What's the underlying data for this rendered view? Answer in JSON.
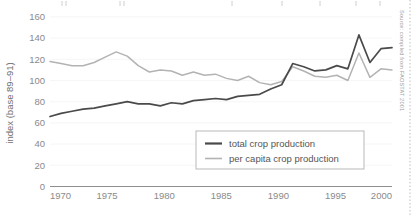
{
  "chart_data": {
    "type": "line",
    "title": "",
    "xlabel": "",
    "ylabel": "index (base 89–91)",
    "xlim": [
      1970,
      2001
    ],
    "ylim": [
      0,
      165
    ],
    "xticks": [
      1970,
      1975,
      1980,
      1985,
      1990,
      1995,
      2000
    ],
    "yticks": [
      0,
      20,
      40,
      60,
      80,
      100,
      120,
      140,
      160
    ],
    "grid": true,
    "legend_position": "bottom-right",
    "x": [
      1970,
      1971,
      1972,
      1973,
      1974,
      1975,
      1976,
      1977,
      1978,
      1979,
      1980,
      1981,
      1982,
      1983,
      1984,
      1985,
      1986,
      1987,
      1988,
      1989,
      1990,
      1991,
      1992,
      1993,
      1994,
      1995,
      1996,
      1997,
      1998,
      1999,
      2000,
      2001
    ],
    "series": [
      {
        "name": "total crop production",
        "color": "#4a4a4a",
        "values": [
          66,
          69,
          71,
          73,
          74,
          76,
          78,
          80,
          78,
          78,
          76,
          79,
          78,
          81,
          82,
          83,
          82,
          85,
          86,
          87,
          92,
          96,
          116,
          113,
          109,
          110,
          114,
          111,
          143,
          117,
          130,
          131
        ]
      },
      {
        "name": "per capita crop production",
        "color": "#b3b3b3",
        "values": [
          118,
          116,
          114,
          114,
          117,
          122,
          127,
          123,
          114,
          108,
          110,
          109,
          105,
          108,
          105,
          106,
          102,
          100,
          104,
          98,
          96,
          99,
          113,
          109,
          104,
          103,
          105,
          100,
          126,
          103,
          111,
          110
        ]
      }
    ],
    "legend": [
      {
        "label": "total crop production",
        "style": "dark-line"
      },
      {
        "label": "per capita crop production",
        "style": "light-line"
      }
    ]
  },
  "yaxis": {
    "title": "index (base 89–91)",
    "labels": [
      "160",
      "140",
      "120",
      "100",
      "80",
      "60",
      "40",
      "20",
      "0"
    ]
  },
  "xaxis": {
    "labels": [
      "1970",
      "1975",
      "1980",
      "1985",
      "1990",
      "1995",
      "2000"
    ]
  },
  "legend": {
    "items": [
      {
        "label": "total crop production"
      },
      {
        "label": "per capita crop production"
      }
    ]
  },
  "source": {
    "text": "Source: compiled from FAOSTAT 2001"
  },
  "colors": {
    "total_crop": "#4a4a4a",
    "per_capita_crop": "#b3b3b3",
    "axis": "#8f8f8f",
    "grid": "#f2f2f2",
    "text": "#6b6b6b"
  }
}
